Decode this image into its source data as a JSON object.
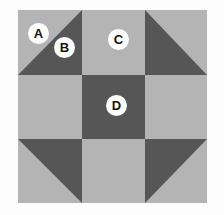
{
  "diagram": {
    "canvas": {
      "width": 224,
      "height": 215,
      "background": "#fdfdfd"
    },
    "palette": {
      "light_fabric": "#b4b4b4",
      "dark_fabric": "#565656",
      "label_circle_fill": "#ffffff",
      "label_text": "#141414"
    },
    "block": {
      "x": 18,
      "y": 10,
      "width": 189,
      "height": 193,
      "rows": 3,
      "columns": 3,
      "grid_x": [
        18,
        82,
        145,
        207
      ],
      "grid_y": [
        10,
        75,
        139,
        203
      ],
      "cells": [
        {
          "id": "r1c1",
          "row": 1,
          "col": 1,
          "type": "half-square-triangle",
          "dark_half": "bottom-right",
          "base": "#b4b4b4",
          "accent": "#565656"
        },
        {
          "id": "r1c2",
          "row": 1,
          "col": 2,
          "type": "solid",
          "base": "#b4b4b4"
        },
        {
          "id": "r1c3",
          "row": 1,
          "col": 3,
          "type": "half-square-triangle",
          "dark_half": "bottom-left",
          "base": "#b4b4b4",
          "accent": "#565656"
        },
        {
          "id": "r2c1",
          "row": 2,
          "col": 1,
          "type": "solid",
          "base": "#b4b4b4"
        },
        {
          "id": "r2c2",
          "row": 2,
          "col": 2,
          "type": "solid",
          "base": "#565656"
        },
        {
          "id": "r2c3",
          "row": 2,
          "col": 3,
          "type": "solid",
          "base": "#b4b4b4"
        },
        {
          "id": "r3c1",
          "row": 3,
          "col": 1,
          "type": "half-square-triangle",
          "dark_half": "top-right",
          "base": "#b4b4b4",
          "accent": "#565656"
        },
        {
          "id": "r3c2",
          "row": 3,
          "col": 2,
          "type": "solid",
          "base": "#b4b4b4"
        },
        {
          "id": "r3c3",
          "row": 3,
          "col": 3,
          "type": "half-square-triangle",
          "dark_half": "top-left",
          "base": "#b4b4b4",
          "accent": "#565656"
        }
      ]
    },
    "labels": [
      {
        "id": "label-a",
        "text": "A",
        "x": 28,
        "y": 23,
        "refers_to": "r1c1-light-triangle"
      },
      {
        "id": "label-b",
        "text": "B",
        "x": 54,
        "y": 37,
        "refers_to": "r1c1-dark-triangle"
      },
      {
        "id": "label-c",
        "text": "C",
        "x": 108,
        "y": 29,
        "refers_to": "r1c2-solid-light"
      },
      {
        "id": "label-d",
        "text": "D",
        "x": 106,
        "y": 95,
        "refers_to": "r2c2-solid-dark"
      }
    ]
  }
}
